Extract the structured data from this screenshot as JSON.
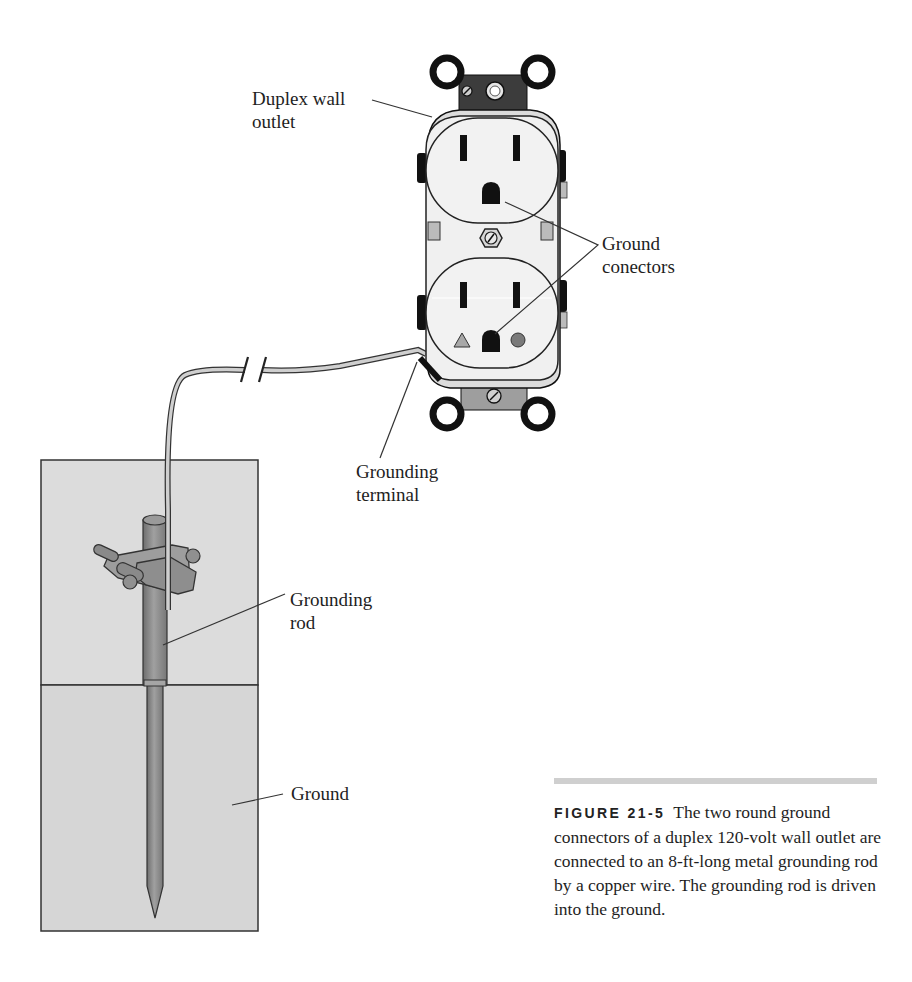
{
  "labels": {
    "outlet": [
      "Duplex wall",
      "outlet"
    ],
    "ground_connectors": [
      "Ground",
      "conectors"
    ],
    "grounding_terminal": [
      "Grounding",
      "terminal"
    ],
    "grounding_rod": [
      "Grounding",
      "rod"
    ],
    "ground": [
      "Ground"
    ]
  },
  "caption": {
    "figure_number": "FIGURE 21-5",
    "text": "The two round ground connectors of a duplex 120-volt wall outlet are connected to an 8-ft-long metal grounding rod by a copper wire. The grounding rod is driven into the ground."
  },
  "colors": {
    "outlet_face": "#f2f2f2",
    "outlet_line": "#222222",
    "mount_strap": "#3a3a3a",
    "soil": "#d9d9d9",
    "rod": "#8c8c8c",
    "wire": "#c8c8c8",
    "triangle_marker": "#a8a8a8",
    "circle_marker": "#7a7a7a",
    "caption_rule": "#cfcfcf"
  }
}
